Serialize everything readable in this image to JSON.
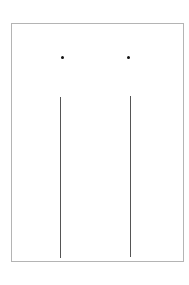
{
  "diagram": {
    "frame": {
      "x": 11,
      "y": 23,
      "width": 173,
      "height": 239,
      "stroke": "#b4b4b4"
    },
    "dots": [
      {
        "x": 62,
        "y": 57,
        "color": "#111111"
      },
      {
        "x": 128,
        "y": 57,
        "color": "#111111"
      }
    ],
    "lines": [
      {
        "x": 60,
        "y1": 97,
        "y2": 258,
        "color": "#555555"
      },
      {
        "x": 130,
        "y1": 96,
        "y2": 257,
        "color": "#555555"
      }
    ]
  }
}
